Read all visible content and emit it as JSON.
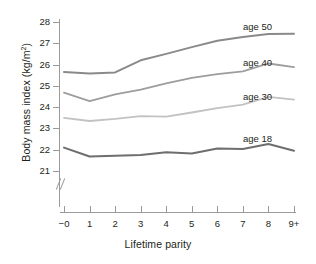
{
  "chart_data": {
    "type": "line",
    "title": "",
    "xlabel": "Lifetime parity",
    "ylabel": "Body mass index (kg/m2)",
    "ylabel_display": "Body mass index (kg/m",
    "ylabel_sup": "2",
    "ylabel_close": ")",
    "categories": [
      "−0",
      "1",
      "2",
      "3",
      "4",
      "5",
      "6",
      "7",
      "8",
      "9+"
    ],
    "x": [
      0,
      1,
      2,
      3,
      4,
      5,
      6,
      7,
      8,
      9
    ],
    "yticks": [
      21,
      22,
      23,
      24,
      25,
      26,
      27,
      28
    ],
    "ytick_labels": [
      "21",
      "22",
      "23",
      "24",
      "25",
      "26",
      "27",
      "28"
    ],
    "ylim": [
      20.7,
      28.0
    ],
    "xlim": [
      0,
      9
    ],
    "axis_break": true,
    "grid": false,
    "legend_position": "inline-right",
    "series": [
      {
        "name": "age 50",
        "label": "age 50",
        "color": "#8a8a8a",
        "width": 2.0,
        "values": [
          25.65,
          25.58,
          25.63,
          26.2,
          26.5,
          26.82,
          27.12,
          27.3,
          27.43,
          27.45
        ]
      },
      {
        "name": "age 40",
        "label": "age 40",
        "color": "#9d9d9d",
        "width": 1.8,
        "values": [
          24.68,
          24.28,
          24.6,
          24.82,
          25.12,
          25.38,
          25.55,
          25.68,
          26.05,
          25.88
        ]
      },
      {
        "name": "age 30",
        "label": "age 30",
        "color": "#c2c2c2",
        "width": 1.8,
        "values": [
          23.5,
          23.35,
          23.45,
          23.58,
          23.55,
          23.75,
          23.95,
          24.12,
          24.48,
          24.35
        ]
      },
      {
        "name": "age 18",
        "label": "age 18",
        "color": "#6e6e6e",
        "width": 2.0,
        "values": [
          22.1,
          21.68,
          21.72,
          21.75,
          21.88,
          21.82,
          22.05,
          22.03,
          22.27,
          21.95
        ]
      }
    ],
    "series_label_positions": [
      {
        "name": "age 50",
        "left": 243,
        "top": 22
      },
      {
        "name": "age 40",
        "left": 243,
        "top": 58
      },
      {
        "name": "age 30",
        "left": 243,
        "top": 92
      },
      {
        "name": "age 18",
        "left": 243,
        "top": 134
      }
    ]
  }
}
